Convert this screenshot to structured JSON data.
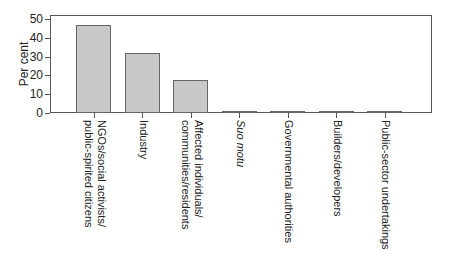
{
  "chart_data": {
    "type": "bar",
    "title": "",
    "xlabel": "",
    "ylabel": "Per cent",
    "ylim": [
      0,
      50
    ],
    "yticks": [
      0,
      10,
      20,
      30,
      40,
      50
    ],
    "grid": false,
    "legend": null,
    "categories": [
      "NGOs/social activists/ public-spirited citizens",
      "Industry",
      "Affected individuals/ communities/residents",
      "Suo motu",
      "Governmental authorities",
      "Builders/developers",
      "Public-sector undertakings"
    ],
    "values": [
      47,
      32,
      17.5,
      0.5,
      0.5,
      0.5,
      0.5
    ]
  },
  "labels": {
    "ylabel": "Per cent",
    "yticks": [
      "0",
      "10",
      "20",
      "30",
      "40",
      "50"
    ],
    "x": [
      "NGOs/social activists/\npublic-spirited citizens",
      "Industry",
      "Affected individuals/\ncommunities/residents",
      "Suo motu",
      "Governmental authorities",
      "Builders/developers",
      "Public-sector undertakings"
    ]
  },
  "colors": {
    "bar_fill": "#c8c8c8",
    "bar_edge": "#666666",
    "axis": "#555555"
  }
}
